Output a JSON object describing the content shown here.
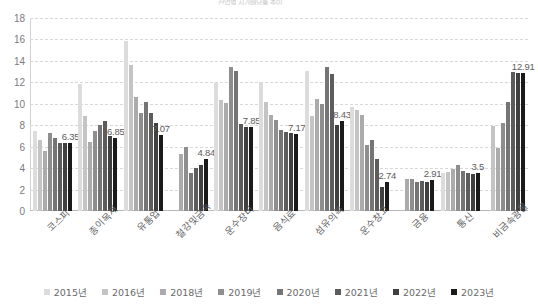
{
  "title_sliver": "산업별 시가배당률 추이",
  "legend": {
    "position": "bottom",
    "items": [
      {
        "label": "2015년",
        "color": "#dcdcdc"
      },
      {
        "label": "2016년",
        "color": "#c4c4c4"
      },
      {
        "label": "2018년",
        "color": "#ababab"
      },
      {
        "label": "2019년",
        "color": "#8e8e8e"
      },
      {
        "label": "2020년",
        "color": "#757575"
      },
      {
        "label": "2021년",
        "color": "#5c5c5c"
      },
      {
        "label": "2022년",
        "color": "#404040"
      },
      {
        "label": "2023년",
        "color": "#1a1a1a"
      }
    ]
  },
  "axis": {
    "yticks": [
      "0",
      "2",
      "4",
      "6",
      "8",
      "10",
      "12",
      "14",
      "16",
      "18"
    ],
    "ymin": 0,
    "ymax": 18
  },
  "chart_data": {
    "type": "bar",
    "title": "산업별 시가배당률 추이",
    "xlabel": "",
    "ylabel": "",
    "ylim": [
      0,
      18
    ],
    "ytick_step": 2,
    "grid": true,
    "legend_position": "bottom",
    "categories": [
      "코스피",
      "종이목재",
      "유통업",
      "철강및금속",
      "운수장비",
      "음식료",
      "섬유의복",
      "운수창고",
      "금융",
      "통신",
      "비금속광물"
    ],
    "series": [
      {
        "name": "2015년",
        "color": "#dcdcdc",
        "values": [
          7.45,
          11.85,
          15.85,
          0,
          11.95,
          12.0,
          13.1,
          9.7,
          0,
          3.55,
          0
        ]
      },
      {
        "name": "2016년",
        "color": "#c4c4c4",
        "values": [
          6.6,
          8.9,
          13.6,
          0,
          10.4,
          10.15,
          8.85,
          9.45,
          0,
          3.65,
          7.9
        ]
      },
      {
        "name": "2018년",
        "color": "#ababab",
        "values": [
          5.6,
          6.4,
          10.65,
          5.3,
          10.1,
          9.0,
          10.45,
          8.95,
          2.95,
          3.9,
          5.85
        ]
      },
      {
        "name": "2019년",
        "color": "#8e8e8e",
        "values": [
          7.3,
          7.45,
          9.15,
          6.0,
          13.4,
          8.45,
          10.0,
          6.2,
          3.0,
          4.25,
          8.2
        ]
      },
      {
        "name": "2020년",
        "color": "#757575",
        "values": [
          6.85,
          8.0,
          10.2,
          3.5,
          13.1,
          7.6,
          13.4,
          6.6,
          2.75,
          3.7,
          10.2
        ]
      },
      {
        "name": "2021년",
        "color": "#5c5c5c",
        "values": [
          6.35,
          8.35,
          9.1,
          4.05,
          8.15,
          7.4,
          12.75,
          4.85,
          2.8,
          3.55,
          12.95
        ]
      },
      {
        "name": "2022년",
        "color": "#404040",
        "values": [
          6.35,
          6.95,
          8.2,
          4.25,
          7.85,
          7.3,
          8.0,
          2.2,
          2.7,
          3.45,
          12.9
        ]
      },
      {
        "name": "2023년",
        "color": "#1a1a1a",
        "values": [
          6.35,
          6.85,
          7.07,
          4.84,
          7.85,
          7.17,
          8.43,
          2.74,
          2.91,
          3.5,
          12.91
        ]
      }
    ],
    "data_labels": {
      "series": "2023년",
      "values": [
        "6.35",
        "6.85",
        "7.07",
        "4.84",
        "7.85",
        "7.17",
        "8.43",
        "2.74",
        "2.91",
        "3.5",
        "12.91"
      ]
    }
  }
}
